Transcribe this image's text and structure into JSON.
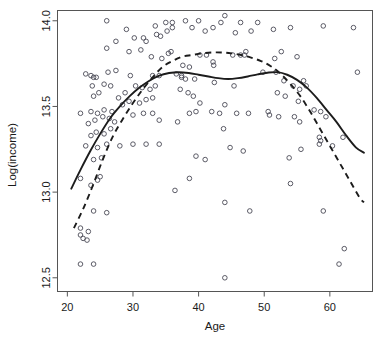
{
  "chart_data": {
    "type": "scatter",
    "title": "",
    "xlabel": "Age",
    "ylabel": "Log(income)",
    "xlim": [
      18.5,
      66.5
    ],
    "ylim": [
      12.42,
      14.06
    ],
    "xticks": [
      20,
      30,
      40,
      50,
      60
    ],
    "xtick_labels": [
      "20",
      "30",
      "40",
      "50",
      "60"
    ],
    "yticks": [
      12.5,
      13.0,
      13.5,
      14.0
    ],
    "ytick_labels": [
      "12.5",
      "13.0",
      "13.5",
      "14.0"
    ],
    "grid": false,
    "legend": "none",
    "point_marker": "open-circle",
    "points": [
      [
        22,
        12.58
      ],
      [
        24,
        12.58
      ],
      [
        22,
        12.75
      ],
      [
        22.4,
        12.73
      ],
      [
        23,
        12.72
      ],
      [
        22,
        12.79
      ],
      [
        23.2,
        12.77
      ],
      [
        24,
        12.89
      ],
      [
        26,
        12.88
      ],
      [
        22,
        13.08
      ],
      [
        23.6,
        13.04
      ],
      [
        24.6,
        13.07
      ],
      [
        25,
        13.09
      ],
      [
        24,
        13.19
      ],
      [
        25.2,
        13.2
      ],
      [
        24.6,
        13.26
      ],
      [
        26,
        13.28
      ],
      [
        28,
        13.27
      ],
      [
        30,
        13.28
      ],
      [
        32,
        13.28
      ],
      [
        34,
        13.28
      ],
      [
        22.8,
        13.27
      ],
      [
        23.6,
        13.33
      ],
      [
        24.4,
        13.35
      ],
      [
        25.6,
        13.34
      ],
      [
        26.6,
        13.37
      ],
      [
        23.2,
        13.4
      ],
      [
        24.2,
        13.42
      ],
      [
        25.4,
        13.44
      ],
      [
        26.4,
        13.43
      ],
      [
        27.2,
        13.41
      ],
      [
        22,
        13.46
      ],
      [
        23.6,
        13.47
      ],
      [
        24.6,
        13.46
      ],
      [
        25.6,
        13.48
      ],
      [
        26.8,
        13.47
      ],
      [
        30,
        13.45
      ],
      [
        31.6,
        13.46
      ],
      [
        33,
        13.46
      ],
      [
        34,
        13.42
      ],
      [
        28.4,
        13.51
      ],
      [
        29.4,
        13.53
      ],
      [
        31,
        13.52
      ],
      [
        32,
        13.54
      ],
      [
        33,
        13.55
      ],
      [
        24,
        13.56
      ],
      [
        24.8,
        13.58
      ],
      [
        27.8,
        13.55
      ],
      [
        28.8,
        13.58
      ],
      [
        23.8,
        13.62
      ],
      [
        25.6,
        13.63
      ],
      [
        26.6,
        13.62
      ],
      [
        30.4,
        13.62
      ],
      [
        31.4,
        13.61
      ],
      [
        32.6,
        13.6
      ],
      [
        33.4,
        13.62
      ],
      [
        22.8,
        13.69
      ],
      [
        23.6,
        13.68
      ],
      [
        24,
        13.67
      ],
      [
        24.4,
        13.67
      ],
      [
        26.2,
        13.7
      ],
      [
        27.4,
        13.71
      ],
      [
        29.6,
        13.68
      ],
      [
        33,
        13.68
      ],
      [
        34,
        13.68
      ],
      [
        36.6,
        13.69
      ],
      [
        37.4,
        13.68
      ],
      [
        26,
        13.84
      ],
      [
        29.4,
        13.82
      ],
      [
        31.2,
        13.83
      ],
      [
        32.8,
        13.79
      ],
      [
        34.4,
        13.78
      ],
      [
        35.4,
        13.81
      ],
      [
        35.8,
        13.82
      ],
      [
        27.4,
        13.88
      ],
      [
        30.2,
        13.9
      ],
      [
        31.6,
        13.9
      ],
      [
        32,
        13.88
      ],
      [
        33.6,
        13.92
      ],
      [
        34.2,
        13.91
      ],
      [
        35.2,
        13.94
      ],
      [
        36,
        13.96
      ],
      [
        26,
        14.0
      ],
      [
        29,
        13.95
      ],
      [
        33.4,
        13.97
      ],
      [
        35,
        13.99
      ],
      [
        36,
        13.99
      ],
      [
        38,
        14.0
      ],
      [
        39,
        13.96
      ],
      [
        40,
        14.0
      ],
      [
        41,
        13.94
      ],
      [
        42.2,
        13.96
      ],
      [
        43.4,
        13.99
      ],
      [
        44,
        14.03
      ],
      [
        45.6,
        13.93
      ],
      [
        46.4,
        13.99
      ],
      [
        48,
        13.94
      ],
      [
        49,
        13.99
      ],
      [
        51.4,
        13.95
      ],
      [
        54,
        13.96
      ],
      [
        59,
        13.97
      ],
      [
        63.6,
        13.96
      ],
      [
        37.6,
        13.74
      ],
      [
        38.6,
        13.73
      ],
      [
        40.2,
        13.8
      ],
      [
        41.2,
        13.8
      ],
      [
        42.2,
        13.76
      ],
      [
        42.3,
        13.74
      ],
      [
        45.2,
        13.8
      ],
      [
        46.4,
        13.8
      ],
      [
        47,
        13.8
      ],
      [
        47.2,
        13.82
      ],
      [
        51.6,
        13.78
      ],
      [
        52.6,
        13.82
      ],
      [
        55,
        13.79
      ],
      [
        37.4,
        13.67
      ],
      [
        38,
        13.66
      ],
      [
        39.4,
        13.66
      ],
      [
        42.4,
        13.64
      ],
      [
        45.4,
        13.62
      ],
      [
        49.8,
        13.7
      ],
      [
        51.8,
        13.7
      ],
      [
        53,
        13.65
      ],
      [
        54.4,
        13.62
      ],
      [
        55.4,
        13.6
      ],
      [
        56,
        13.65
      ],
      [
        56.4,
        13.62
      ],
      [
        52,
        13.58
      ],
      [
        53.2,
        13.56
      ],
      [
        55.2,
        13.53
      ],
      [
        37.2,
        13.6
      ],
      [
        38.4,
        13.58
      ],
      [
        39.2,
        13.56
      ],
      [
        40.2,
        13.52
      ],
      [
        44,
        13.51
      ],
      [
        45.8,
        13.46
      ],
      [
        47.6,
        13.46
      ],
      [
        50.6,
        13.47
      ],
      [
        50.8,
        13.45
      ],
      [
        52.2,
        13.44
      ],
      [
        54.6,
        13.44
      ],
      [
        55.4,
        13.41
      ],
      [
        57.6,
        13.48
      ],
      [
        58.6,
        13.47
      ],
      [
        59.4,
        13.44
      ],
      [
        64.2,
        13.7
      ],
      [
        38.6,
        13.46
      ],
      [
        39.6,
        13.47
      ],
      [
        42,
        13.47
      ],
      [
        43.2,
        13.46
      ],
      [
        36.8,
        13.41
      ],
      [
        43.8,
        13.37
      ],
      [
        58.4,
        13.32
      ],
      [
        58.6,
        13.3
      ],
      [
        58.4,
        13.28
      ],
      [
        62,
        13.32
      ],
      [
        60.4,
        13.27
      ],
      [
        55.6,
        13.25
      ],
      [
        44.8,
        13.26
      ],
      [
        46.8,
        13.24
      ],
      [
        39.6,
        13.21
      ],
      [
        41,
        13.19
      ],
      [
        53.8,
        13.2
      ],
      [
        38.6,
        13.08
      ],
      [
        36.4,
        13.01
      ],
      [
        44,
        12.94
      ],
      [
        54,
        13.05
      ],
      [
        47.8,
        12.89
      ],
      [
        59,
        12.89
      ],
      [
        61.4,
        12.58
      ],
      [
        62.2,
        12.67
      ],
      [
        44,
        12.5
      ]
    ],
    "curves": [
      {
        "name": "smooth-solid",
        "style": "solid",
        "points": [
          [
            20.6,
            13.02
          ],
          [
            22,
            13.13
          ],
          [
            23.5,
            13.24
          ],
          [
            25,
            13.34
          ],
          [
            26.5,
            13.43
          ],
          [
            28,
            13.5
          ],
          [
            29.5,
            13.56
          ],
          [
            31,
            13.61
          ],
          [
            32.5,
            13.65
          ],
          [
            34,
            13.68
          ],
          [
            35.5,
            13.695
          ],
          [
            37,
            13.7
          ],
          [
            38.5,
            13.695
          ],
          [
            40,
            13.685
          ],
          [
            41.5,
            13.675
          ],
          [
            43,
            13.665
          ],
          [
            44.5,
            13.66
          ],
          [
            46,
            13.665
          ],
          [
            47.5,
            13.675
          ],
          [
            49,
            13.687
          ],
          [
            50.5,
            13.697
          ],
          [
            52,
            13.7
          ],
          [
            53.5,
            13.685
          ],
          [
            55,
            13.655
          ],
          [
            56.5,
            13.61
          ],
          [
            58,
            13.55
          ],
          [
            59.5,
            13.48
          ],
          [
            61,
            13.41
          ],
          [
            62.5,
            13.33
          ],
          [
            64,
            13.26
          ],
          [
            65.2,
            13.23
          ]
        ]
      },
      {
        "name": "smooth-dashed",
        "style": "dashed",
        "points": [
          [
            21,
            12.79
          ],
          [
            22.5,
            12.91
          ],
          [
            24,
            13.05
          ],
          [
            25.5,
            13.2
          ],
          [
            27,
            13.33
          ],
          [
            28.5,
            13.43
          ],
          [
            30,
            13.52
          ],
          [
            31.5,
            13.6
          ],
          [
            33,
            13.67
          ],
          [
            34.5,
            13.73
          ],
          [
            36,
            13.765
          ],
          [
            37.5,
            13.79
          ],
          [
            39,
            13.8
          ],
          [
            40.5,
            13.81
          ],
          [
            42,
            13.815
          ],
          [
            43.5,
            13.815
          ],
          [
            45,
            13.81
          ],
          [
            46.5,
            13.8
          ],
          [
            48,
            13.785
          ],
          [
            49.5,
            13.765
          ],
          [
            51,
            13.735
          ],
          [
            52.5,
            13.69
          ],
          [
            54,
            13.63
          ],
          [
            55.5,
            13.56
          ],
          [
            57,
            13.47
          ],
          [
            58.5,
            13.37
          ],
          [
            60,
            13.27
          ],
          [
            61.5,
            13.17
          ],
          [
            63,
            13.07
          ],
          [
            64.5,
            12.97
          ],
          [
            65.2,
            12.94
          ]
        ]
      }
    ]
  }
}
